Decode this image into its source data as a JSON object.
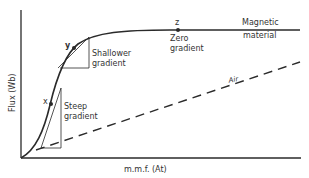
{
  "diagram": {
    "axes": {
      "x_label": "m.m.f. (At)",
      "y_label": "Flux (Wb)"
    },
    "curves": [
      {
        "name": "magnetic-material",
        "label_line1": "Magnetic",
        "label_line2": "material",
        "style": "solid"
      },
      {
        "name": "air",
        "label": "Air",
        "style": "dashed"
      }
    ],
    "points": [
      {
        "id": "x",
        "label": "x",
        "annotation_line1": "Steep",
        "annotation_line2": "gradient"
      },
      {
        "id": "y",
        "label": "y",
        "annotation_line1": "Shallower",
        "annotation_line2": "gradient"
      },
      {
        "id": "z",
        "label": "z",
        "annotation_line1": "Zero",
        "annotation_line2": "gradient"
      }
    ],
    "colors": {
      "line": "#2a2a2a",
      "text": "#333333",
      "background": "#ffffff"
    }
  }
}
